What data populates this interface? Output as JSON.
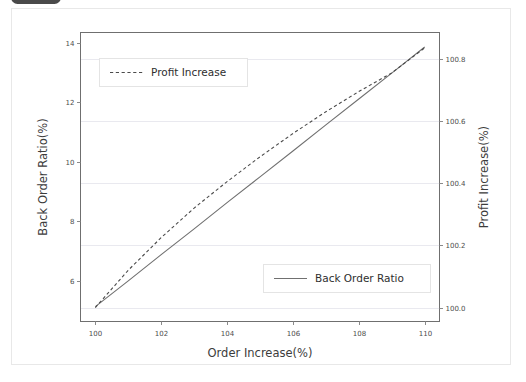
{
  "window": {
    "top_chip": "",
    "background_color": "#ffffff",
    "card_border_color": "#e8e8e8"
  },
  "chart_data": {
    "type": "line",
    "title": "",
    "xlabel": "Order Increase(%)",
    "ylabel": "Back Order Ratio(%)",
    "y2label": "Profit Increase(%)",
    "xlim": [
      99.55,
      110.45
    ],
    "ylim": [
      4.62,
      14.35
    ],
    "y2lim": [
      99.955,
      100.885
    ],
    "grid": true,
    "grid_axis": "y2",
    "xticks": [
      100,
      102,
      104,
      106,
      108,
      110
    ],
    "xticklabels": [
      "100",
      "102",
      "104",
      "106",
      "108",
      "110"
    ],
    "yticks": [
      6,
      8,
      10,
      12,
      14
    ],
    "yticklabels": [
      "6",
      "8",
      "10",
      "12",
      "14"
    ],
    "y2ticks": [
      100.0,
      100.2,
      100.4,
      100.6,
      100.8
    ],
    "y2ticklabels": [
      "100.0",
      "100.2",
      "100.4",
      "100.6",
      "100.8"
    ],
    "series": [
      {
        "name": "Back Order Ratio",
        "axis": "left",
        "style": "solid",
        "color": "#707070",
        "x": [
          100,
          101,
          102,
          103,
          104,
          105,
          106,
          107,
          108,
          109,
          110
        ],
        "values": [
          5.12,
          5.99,
          6.87,
          7.74,
          8.62,
          9.49,
          10.36,
          11.24,
          12.11,
          12.98,
          13.86
        ]
      },
      {
        "name": "Profit Increase",
        "axis": "right",
        "style": "dashed",
        "color": "#4b4b4b",
        "x": [
          100,
          101,
          102,
          103,
          104,
          105,
          106,
          107,
          108,
          109,
          110
        ],
        "values": [
          100.0,
          100.12,
          100.225,
          100.32,
          100.405,
          100.485,
          100.56,
          100.63,
          100.695,
          100.755,
          100.8355
        ]
      }
    ],
    "legends": [
      {
        "label": "Profit Increase",
        "style": "dashed",
        "position": "upper-left"
      },
      {
        "label": "Back Order Ratio",
        "style": "solid",
        "position": "lower-right"
      }
    ]
  }
}
